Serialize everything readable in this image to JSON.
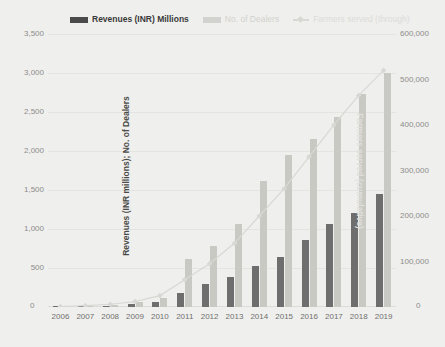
{
  "chart_data": {
    "type": "bar",
    "title": "",
    "subtitle": "",
    "xlabel": "",
    "ylabel": "Revenues (INR millions); No. of Dealers",
    "y2label": "Farmers served (cumulative)",
    "ylim": [
      0,
      3500
    ],
    "y2lim": [
      0,
      600000
    ],
    "grid": true,
    "legend_position": "top-center",
    "categories": [
      "2006",
      "2007",
      "2008",
      "2009",
      "2010",
      "2011",
      "2012",
      "2013",
      "2014",
      "2015",
      "2016",
      "2017",
      "2018",
      "2019"
    ],
    "yticks": [
      "0",
      "500",
      "1,000",
      "1,500",
      "2,000",
      "2,500",
      "3,000",
      "3,500"
    ],
    "y2ticks": [
      "0",
      "100,000",
      "200,000",
      "300,000",
      "400,000",
      "500,000",
      "600,000"
    ],
    "series": [
      {
        "name": "Revenues (INR) Millions",
        "type": "bar",
        "axis": "left",
        "color": "#6e6e6e",
        "values": [
          5,
          10,
          18,
          35,
          70,
          180,
          290,
          380,
          520,
          640,
          860,
          1060,
          1200,
          1450
        ]
      },
      {
        "name": "No. of Dealers",
        "type": "bar",
        "axis": "left",
        "color": "#c9c9c4",
        "values": [
          8,
          15,
          30,
          60,
          110,
          610,
          780,
          1060,
          1620,
          1950,
          2150,
          2430,
          2730,
          3000
        ]
      },
      {
        "name": "Farmers served (through)",
        "type": "line",
        "axis": "right",
        "color": "#d8d8d4",
        "values": [
          1000,
          3000,
          6000,
          12000,
          25000,
          60000,
          95000,
          140000,
          200000,
          260000,
          330000,
          400000,
          465000,
          520000
        ]
      }
    ]
  },
  "legend": {
    "items": [
      {
        "label": "Revenues (INR) Millions",
        "marker": "bar-swatch-dark",
        "color": "#4a4a4a"
      },
      {
        "label": "No. of Dealers",
        "marker": "bar-swatch-light",
        "color": "#d2d2ce"
      },
      {
        "label": "Farmers served (through)",
        "marker": "line-marker",
        "color": "#dcdcd8"
      }
    ]
  },
  "axes": {
    "left_zero": "0",
    "right_zero": "0"
  }
}
